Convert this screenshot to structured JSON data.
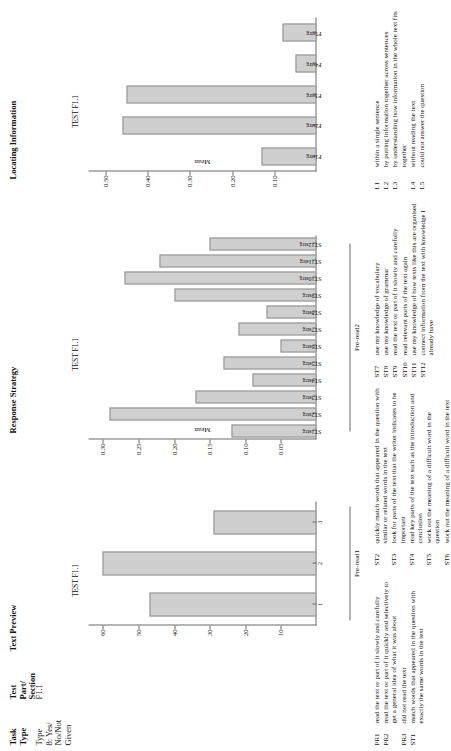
{
  "headers": {
    "task_type": "Task\nType",
    "test_part_section": "Test\nPart/\nSection",
    "text_preview": "Text Preview",
    "response_strategy": "Response Strategy",
    "locating_information": "Locating Information"
  },
  "row": {
    "task_type_value": "Type\n8: Yes/\nNo/Not\nGiven",
    "test_part_value": "F1.1"
  },
  "chart_data": [
    {
      "id": "text-preview",
      "type": "bar",
      "title": "TEST F1.1",
      "ylabel": "Percent",
      "xlabel": "Pre-read1",
      "categories": [
        "1",
        "2",
        "3"
      ],
      "values": [
        47,
        60,
        29
      ],
      "yticks": [
        10,
        20,
        30,
        40,
        50,
        60
      ],
      "ylim": [
        0,
        64
      ],
      "grid": false,
      "legend": "none"
    },
    {
      "id": "response-strategy",
      "type": "bar",
      "title": "TEST F1.1",
      "ylabel": "Mean",
      "xlabel": "Pre-read2",
      "categories": [
        "ST1strg",
        "ST2strg",
        "ST3strg",
        "ST4strg",
        "ST5strg",
        "ST6strg",
        "ST7strg",
        "ST8strg",
        "ST9strg",
        "ST10strg",
        "ST11strg",
        "ST12strg"
      ],
      "values": [
        0.12,
        0.29,
        0.17,
        0.09,
        0.13,
        0.05,
        0.11,
        0.07,
        0.2,
        0.27,
        0.22,
        0.15
      ],
      "yticks": [
        0.05,
        0.1,
        0.15,
        0.2,
        0.25,
        0.3
      ],
      "ylim": [
        0,
        0.32
      ],
      "grid": false,
      "legend": "none"
    },
    {
      "id": "locating-information",
      "type": "bar",
      "title": "TEST F1.1",
      "ylabel": "Mean",
      "xlabel": "",
      "categories": [
        "F1strg",
        "F2strg",
        "F3strg",
        "F4strg",
        "F5strg"
      ],
      "values": [
        0.13,
        0.46,
        0.45,
        0.05,
        0.08
      ],
      "yticks": [
        0.1,
        0.2,
        0.3,
        0.4,
        0.5
      ],
      "ylim": [
        0,
        0.54
      ],
      "grid": false,
      "legend": "none"
    }
  ],
  "legend": {
    "col1": [
      {
        "code": "PR1",
        "text": "read the text or part of it slowly and carefully"
      },
      {
        "code": "PR2",
        "text": "read the text or part of it quickly and selectively to get a general idea of what it was about"
      },
      {
        "code": "PR3",
        "text": "did not read the text"
      },
      {
        "code": "ST1",
        "text": "match words that appeared in the question with exactly the same words in the text"
      }
    ],
    "col2": [
      {
        "code": "ST2",
        "text": "quickly match words that appeared in the question with similar or related words in the text"
      },
      {
        "code": "ST3",
        "text": "look for parts of the text that the writer indicates to be important"
      },
      {
        "code": "ST4",
        "text": "read key parts of the text such as the introduction and conclusion"
      },
      {
        "code": "ST5",
        "text": "work out the meaning of a difficult word in the question"
      },
      {
        "code": "ST6",
        "text": "work out the meaning of a difficult word in the text"
      }
    ],
    "col3": [
      {
        "code": "ST7",
        "text": "use my knowledge of vocabulary"
      },
      {
        "code": "ST8",
        "text": "use my knowledge of grammar"
      },
      {
        "code": "ST9",
        "text": "read the text or part of it slowly and carefully"
      },
      {
        "code": "ST10",
        "text": "read relevant parts of the text again"
      },
      {
        "code": "ST11",
        "text": "use my knowledge of how texts like this are organised"
      },
      {
        "code": "ST12",
        "text": "connect information from the text with knowledge I already have"
      }
    ],
    "col4": [
      {
        "code": "L1",
        "text": "within a single sentence"
      },
      {
        "code": "L2",
        "text": "by putting information together across sentences"
      },
      {
        "code": "L3",
        "text": "by understanding how information in the whole text fits together"
      },
      {
        "code": "L4",
        "text": "without reading the text"
      },
      {
        "code": "L5",
        "text": "could not answer the question"
      }
    ]
  },
  "colors": {
    "bar_fill": "#cfcfcf",
    "bar_stroke": "#8f8f8f",
    "axis": "#6b6b6b",
    "text": "#111111"
  }
}
